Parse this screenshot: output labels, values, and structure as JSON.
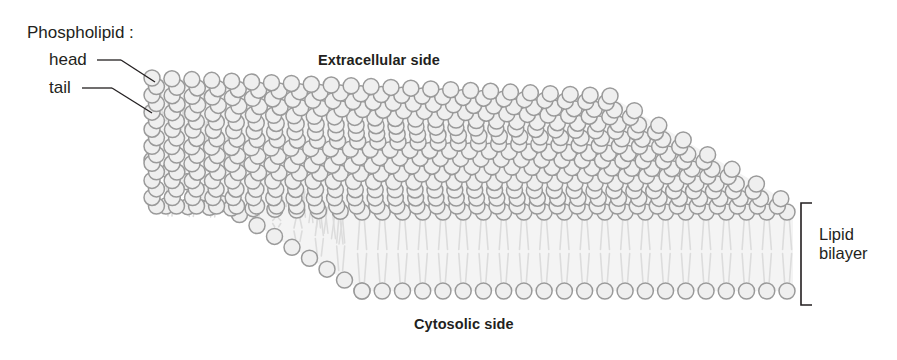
{
  "figure": {
    "width": 897,
    "height": 360,
    "background": "#ffffff"
  },
  "labels": {
    "phospholipid": "Phospholipid :",
    "head": "head",
    "tail": "tail",
    "extracellular": "Extracellular side",
    "cytosolic": "Cytosolic side",
    "lipid_bilayer_line1": "Lipid",
    "lipid_bilayer_line2": "bilayer"
  },
  "colors": {
    "head_stroke": "#9a9a9a",
    "head_fill": "#efefef",
    "tail_stroke": "#dcdcdc",
    "membrane_fill": "#f4f4f4",
    "text": "#231f20",
    "leader_line": "#231f20",
    "bracket": "#231f20"
  },
  "geometry": {
    "top_face": {
      "front_left": [
        152,
        205
      ],
      "front_right": [
        793,
        205
      ],
      "back_left": [
        152,
        78
      ],
      "back_right": [
        610,
        96
      ],
      "depth_dx": 0.78,
      "depth_dy": -0.62
    },
    "head_radius": 8.0,
    "head_spacing_x": 20.2,
    "row_spacing": 11.6,
    "rows": 16,
    "cols": 23,
    "front_top_row_y": 212,
    "front_bottom_row_y": 291,
    "front_row_x_start": 362,
    "front_row_x_end": 787,
    "front_row_count": 22,
    "left_face_top_start": [
      152,
      78
    ],
    "left_face_bottom_start": [
      152,
      160
    ],
    "left_face_steps": 18
  },
  "bracket": {
    "x": 801,
    "y_top": 203,
    "y_bottom": 305,
    "arm_length": 11,
    "stroke_width": 1.6
  },
  "leaders": {
    "head": {
      "dash_x1": 97,
      "dash_y1": 60,
      "dash_x2": 121,
      "dash_y2": 60,
      "line_x1": 121,
      "line_y1": 60,
      "line_x2": 155,
      "line_y2": 82
    },
    "tail": {
      "dash_x1": 82,
      "dash_y1": 88,
      "dash_x2": 112,
      "dash_y2": 88,
      "line_x1": 112,
      "line_y1": 88,
      "line_x2": 152,
      "line_y2": 113
    }
  },
  "diagram_content": {
    "type": "biological-schematic",
    "subject": "lipid bilayer",
    "leaflets": [
      "outer (extracellular) leaflet",
      "inner (cytosolic) leaflet"
    ],
    "components": [
      "hydrophilic phospholipid head",
      "hydrophobic phospholipid tail"
    ],
    "annotated_sides": [
      "Extracellular side",
      "Cytosolic side"
    ],
    "bracket_label": "Lipid bilayer"
  }
}
